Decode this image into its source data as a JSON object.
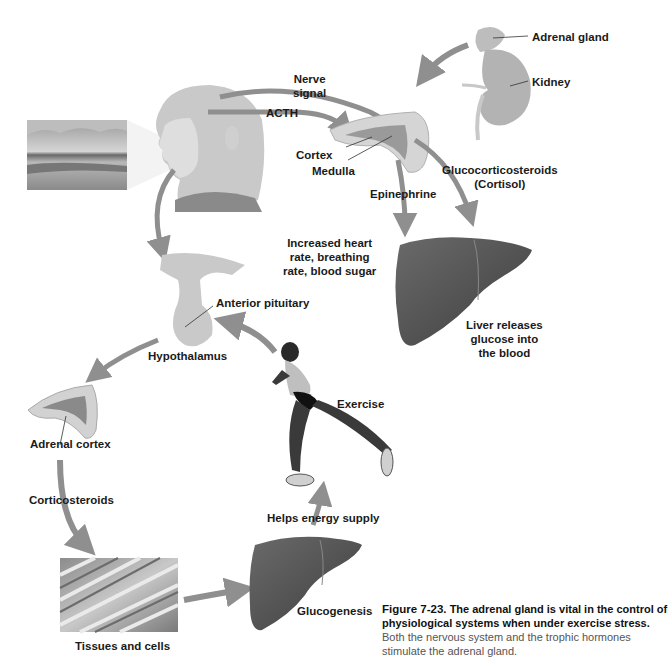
{
  "labels": {
    "adrenal_gland": "Adrenal gland",
    "kidney": "Kidney",
    "nerve_signal_1": "Nerve",
    "nerve_signal_2": "signal",
    "acth": "ACTH",
    "cortex": "Cortex",
    "medulla": "Medulla",
    "epinephrine": "Epinephrine",
    "glucocorticosteroids_1": "Glucocorticosteroids",
    "glucocorticosteroids_2": "(Cortisol)",
    "increased_1": "Increased heart",
    "increased_2": "rate, breathing",
    "increased_3": "rate, blood sugar",
    "liver_releases_1": "Liver releases",
    "liver_releases_2": "glucose into",
    "liver_releases_3": "the blood",
    "anterior_pituitary": "Anterior pituitary",
    "hypothalamus": "Hypothalamus",
    "exercise": "Exercise",
    "adrenal_cortex": "Adrenal cortex",
    "corticosteroids": "Corticosteroids",
    "helps_energy_supply": "Helps energy supply",
    "glucogenesis": "Glucogenesis",
    "tissues_and_cells": "Tissues and cells"
  },
  "caption": {
    "figure_number": "Figure 7-23.",
    "bold_text": "The adrenal gland is vital in the control of physiological systems when under exercise stress.",
    "body_text": "Both the nervous system and the trophic hormones stimulate the adrenal gland."
  },
  "colors": {
    "arrow": "#8f8f8f",
    "liver": "#5a5a5a",
    "skin": "#d8d8d8",
    "gland": "#cfcfcf",
    "text": "#1a1a1a"
  }
}
